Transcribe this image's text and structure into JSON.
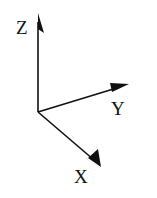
{
  "diagram": {
    "title": "",
    "type": "3d-coordinate-axes",
    "origin": [
      38,
      112
    ],
    "axes": [
      {
        "name": "z",
        "label": "Z",
        "tip": [
          38,
          14
        ],
        "label_pos": [
          16,
          34
        ]
      },
      {
        "name": "y",
        "label": "Y",
        "tip": [
          129,
          83
        ],
        "label_pos": [
          111,
          115
        ]
      },
      {
        "name": "x",
        "label": "X",
        "tip": [
          101,
          167
        ],
        "label_pos": [
          74,
          183
        ]
      }
    ],
    "colors": {
      "stroke": "#111111",
      "background": "#ffffff"
    }
  }
}
